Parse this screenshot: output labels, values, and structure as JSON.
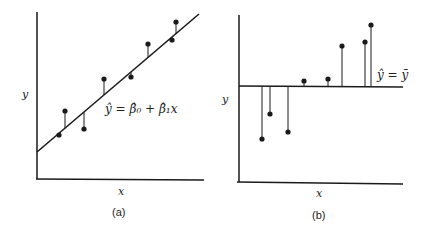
{
  "panels": [
    {
      "id": "a",
      "caption": "(a)",
      "xlabel": "x",
      "ylabel": "y",
      "equation": "ŷ = β̂₀ + β̂₁x",
      "points": [
        [
          59,
          135
        ],
        [
          65,
          111
        ],
        [
          84,
          129
        ],
        [
          104,
          79
        ],
        [
          131,
          77
        ],
        [
          148,
          44
        ],
        [
          172,
          40
        ],
        [
          176,
          22
        ]
      ],
      "fit_line": [
        [
          37,
          152
        ],
        [
          199,
          14
        ]
      ]
    },
    {
      "id": "b",
      "caption": "(b)",
      "xlabel": "x",
      "ylabel": "y",
      "equation": "ŷ = ȳ",
      "points": [
        [
          262,
          139
        ],
        [
          270,
          114
        ],
        [
          288,
          132
        ],
        [
          304,
          81
        ],
        [
          328,
          79
        ],
        [
          342,
          46
        ],
        [
          365,
          42
        ],
        [
          371,
          25
        ]
      ],
      "mean_line_y": 86
    }
  ],
  "colors": {
    "ink": "#1a1a1a"
  }
}
